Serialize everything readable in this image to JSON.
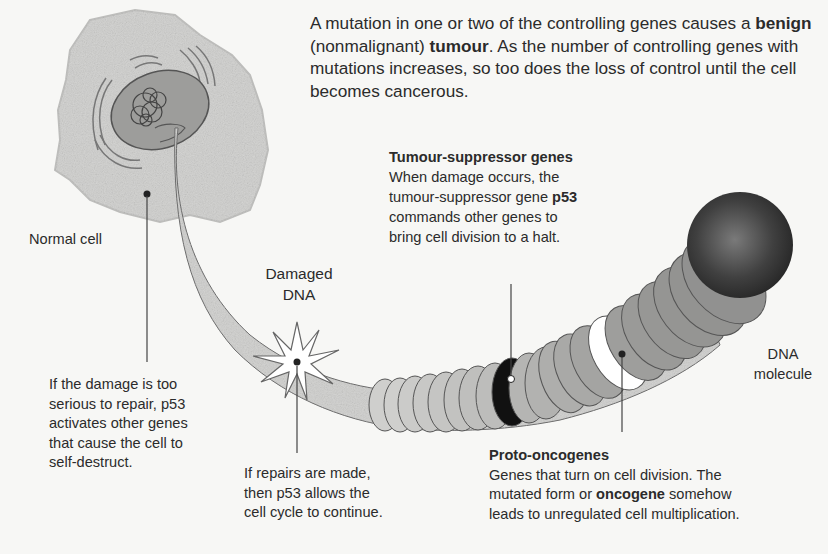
{
  "intro": {
    "part1": "A mutation in one or two of the controlling genes causes a ",
    "benign": "benign",
    "part2": " (nonmalignant) ",
    "tumour": "tumour",
    "part3": ". As the number of controlling genes with mutations increases, so too does the loss of control until the cell becomes cancerous."
  },
  "labels": {
    "normal_cell": "Normal cell",
    "damaged_dna_line1": "Damaged",
    "damaged_dna_line2": "DNA",
    "dna_molecule_line1": "DNA",
    "dna_molecule_line2": "molecule"
  },
  "tumour_suppressor": {
    "heading": "Tumour-suppressor genes",
    "line1": "When damage occurs, the",
    "line2a": "tumour-suppressor gene ",
    "p53": "p53",
    "line3": "commands other genes to",
    "line4": "bring cell division to a halt."
  },
  "self_destruct": {
    "lines": [
      "If the damage is too",
      "serious to repair, p53",
      "activates other genes",
      "that cause the cell to",
      "self-destruct."
    ]
  },
  "repairs": {
    "lines": [
      "If repairs are made,",
      "then p53 allows the",
      "cell cycle to continue."
    ]
  },
  "proto_oncogenes": {
    "heading": "Proto-oncogenes",
    "line1": "Genes that turn on cell division. The",
    "line2a": "mutated form or ",
    "oncogene": "oncogene",
    "line2b": " somehow",
    "line3": "leads to unregulated cell multiplication."
  },
  "colors": {
    "background": "#f7f7f5",
    "cell_fill": "#d2d2d0",
    "nucleus_fill": "#9a9a98",
    "strand_light": "#cfcfcd",
    "strand_mid": "#a8a8a6",
    "strand_dark": "#8a8a88",
    "suppressor_band": "#111111",
    "proto_band": "#ffffff",
    "sphere": "#3a3a3a",
    "text": "#2b2b2b"
  }
}
